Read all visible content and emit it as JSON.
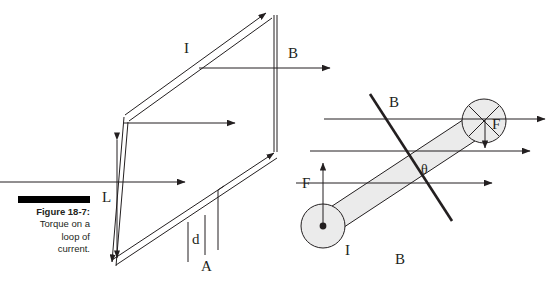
{
  "figure": {
    "caption_title": "Figure 18-7:",
    "caption_lines": [
      "Torque on a",
      "loop of",
      "current."
    ],
    "bar_color": "#000000",
    "line_color": "#231f20",
    "band_fill": "#ebebeb",
    "background": "#ffffff"
  },
  "left_diagram": {
    "name": "current-loop-perspective",
    "labels": {
      "current": "I",
      "field": "B",
      "length": "L",
      "separation": "d",
      "area": "A"
    }
  },
  "right_diagram": {
    "name": "loop-edge-on-view",
    "labels": {
      "field_normal": "B",
      "field_bottom": "B",
      "force_top": "F",
      "force_bottom": "F",
      "current": "I",
      "angle": "θ"
    },
    "markers": {
      "current_out_of_page": "dot-in-circle",
      "current_into_page": "cross-in-circle"
    }
  }
}
